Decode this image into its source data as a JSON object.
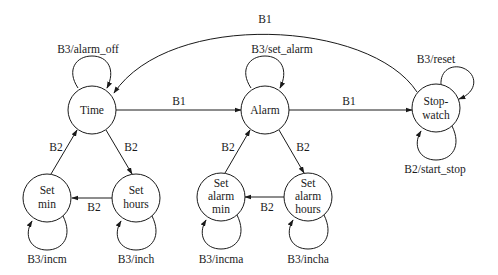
{
  "diagram": {
    "type": "state-machine",
    "colors": {
      "stroke": "#1a1a1a",
      "fill": "#ffffff",
      "background": "#ffffff"
    },
    "states": [
      {
        "id": "time",
        "lines": [
          "Time"
        ],
        "cx": 92,
        "cy": 110,
        "r": 24
      },
      {
        "id": "alarm",
        "lines": [
          "Alarm"
        ],
        "cx": 265,
        "cy": 110,
        "r": 24
      },
      {
        "id": "stopwatch",
        "lines": [
          "Stop-",
          "watch"
        ],
        "cx": 436,
        "cy": 108,
        "r": 24
      },
      {
        "id": "set-min",
        "lines": [
          "Set",
          "min"
        ],
        "cx": 47,
        "cy": 198,
        "r": 24
      },
      {
        "id": "set-hours",
        "lines": [
          "Set",
          "hours"
        ],
        "cx": 136,
        "cy": 198,
        "r": 24
      },
      {
        "id": "set-alarm-min",
        "lines": [
          "Set",
          "alarm",
          "min"
        ],
        "cx": 221,
        "cy": 197,
        "r": 24
      },
      {
        "id": "set-alarm-hours",
        "lines": [
          "Set",
          "alarm",
          "hours"
        ],
        "cx": 308,
        "cy": 197,
        "r": 24
      }
    ],
    "transitions": [
      {
        "from": "time",
        "to": "alarm",
        "label": "B1"
      },
      {
        "from": "alarm",
        "to": "stopwatch",
        "label": "B1"
      },
      {
        "from": "stopwatch",
        "to": "time",
        "label": "B1"
      },
      {
        "from": "time",
        "to": "set-hours",
        "label": "B2"
      },
      {
        "from": "set-hours",
        "to": "set-min",
        "label": "B2"
      },
      {
        "from": "set-min",
        "to": "time",
        "label": "B2"
      },
      {
        "from": "alarm",
        "to": "set-alarm-hours",
        "label": "B2"
      },
      {
        "from": "set-alarm-hours",
        "to": "set-alarm-min",
        "label": "B2"
      },
      {
        "from": "set-alarm-min",
        "to": "alarm",
        "label": "B2"
      }
    ],
    "self_loops": [
      {
        "state": "time",
        "label": "B3/alarm_off"
      },
      {
        "state": "alarm",
        "label": "B3/set_alarm"
      },
      {
        "state": "stopwatch",
        "label": "B3/reset"
      },
      {
        "state": "stopwatch",
        "label": "B2/start_stop"
      },
      {
        "state": "set-min",
        "label": "B3/incm"
      },
      {
        "state": "set-hours",
        "label": "B3/inch"
      },
      {
        "state": "set-alarm-min",
        "label": "B3/incma"
      },
      {
        "state": "set-alarm-hours",
        "label": "B3/incha"
      }
    ]
  }
}
